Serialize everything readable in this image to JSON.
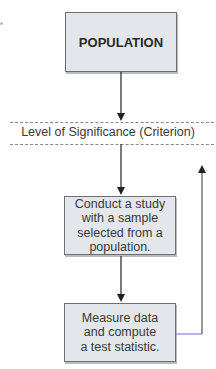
{
  "diagram": {
    "population_box": {
      "label": "POPULATION"
    },
    "criterion_band": {
      "label": "Level of Significance (Criterion)"
    },
    "study_box": {
      "lines": [
        "Conduct a study",
        "with a sample",
        "selected from a",
        "population."
      ]
    },
    "measure_box": {
      "lines": [
        "Measure data",
        "and compute",
        "a test statistic."
      ]
    },
    "colors": {
      "box_fill": "#e3e7eb",
      "box_border": "#6b6f73",
      "arrow": "#222222",
      "feedback_connector": "#6a6fd0"
    },
    "flow": [
      {
        "from": "POPULATION",
        "to": "Level of Significance (Criterion)"
      },
      {
        "from": "Level of Significance (Criterion)",
        "to": "Conduct a study"
      },
      {
        "from": "Conduct a study",
        "to": "Measure data"
      },
      {
        "from": "Measure data",
        "to": "Level of Significance (Criterion)",
        "type": "feedback"
      }
    ]
  }
}
